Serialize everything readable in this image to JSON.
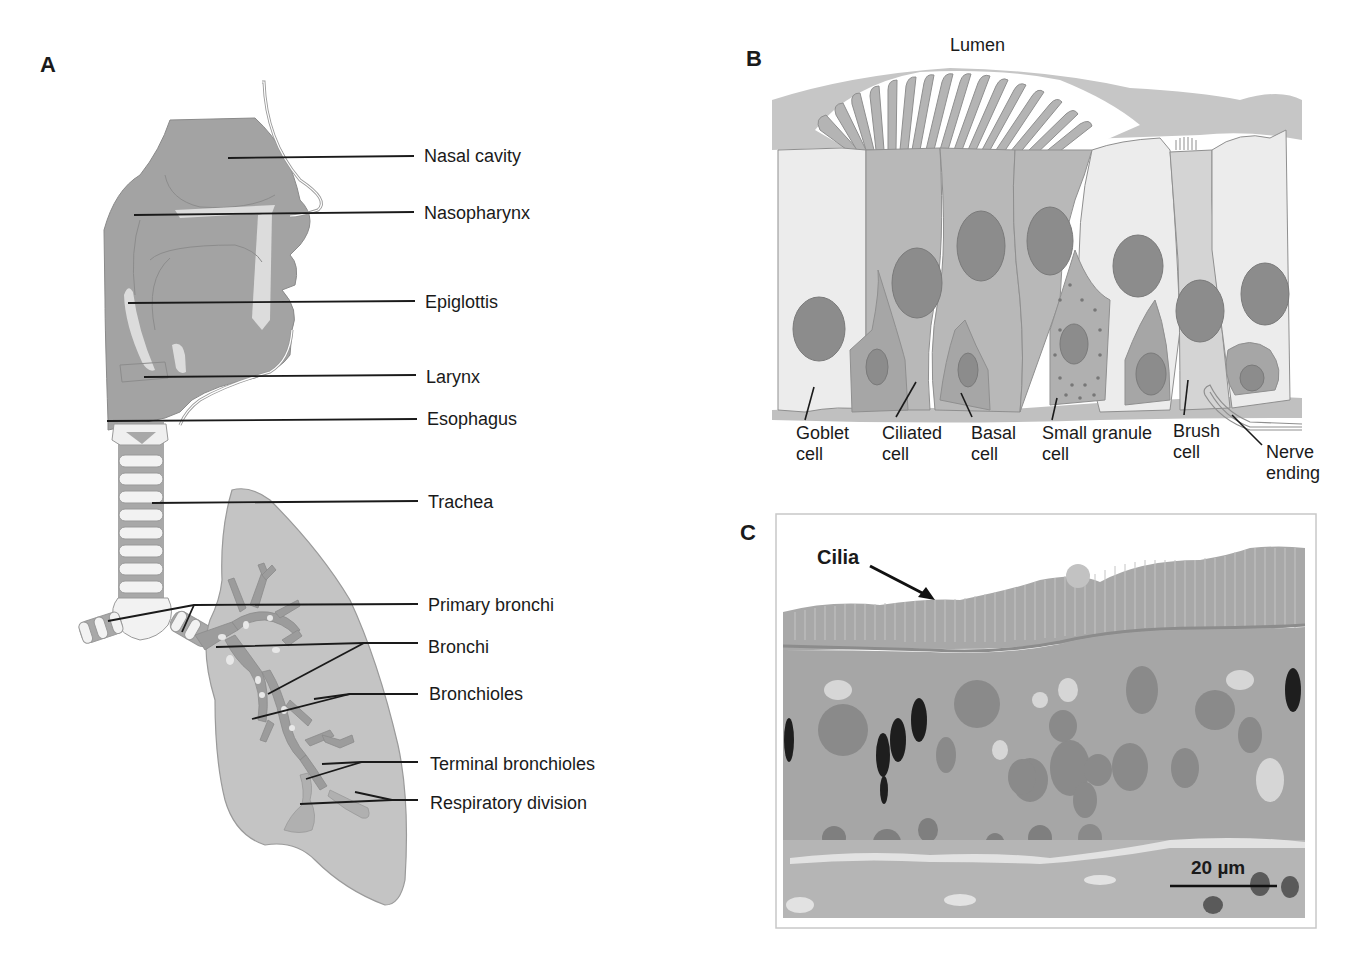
{
  "figure": {
    "panels": {
      "A": {
        "letter": "A",
        "title": "Respiratory tract anatomy",
        "labels": [
          {
            "id": "nasal-cavity",
            "text": "Nasal cavity"
          },
          {
            "id": "nasopharynx",
            "text": "Nasopharynx"
          },
          {
            "id": "epiglottis",
            "text": "Epiglottis"
          },
          {
            "id": "larynx",
            "text": "Larynx"
          },
          {
            "id": "esophagus",
            "text": "Esophagus"
          },
          {
            "id": "trachea",
            "text": "Trachea"
          },
          {
            "id": "primary-bronchi",
            "text": "Primary bronchi"
          },
          {
            "id": "bronchi",
            "text": "Bronchi"
          },
          {
            "id": "bronchioles",
            "text": "Bronchioles"
          },
          {
            "id": "terminal-bronchioles",
            "text": "Terminal bronchioles"
          },
          {
            "id": "respiratory-division",
            "text": "Respiratory division"
          }
        ]
      },
      "B": {
        "letter": "B",
        "top_labels": {
          "lumen": "Lumen",
          "mucus": "Mucus"
        },
        "cells": [
          {
            "id": "goblet",
            "text": "Goblet\ncell"
          },
          {
            "id": "ciliated",
            "text": "Ciliated\ncell"
          },
          {
            "id": "basal",
            "text": "Basal\ncell"
          },
          {
            "id": "small-granule",
            "text": "Small granule\ncell"
          },
          {
            "id": "brush",
            "text": "Brush\ncell"
          },
          {
            "id": "nerve",
            "text": "Nerve\nending"
          }
        ]
      },
      "C": {
        "letter": "C",
        "annotation": "Cilia",
        "scale_bar": "20 µm"
      }
    },
    "colors": {
      "tissue_dark": "#9a9a9a",
      "tissue_mid": "#b4b4b4",
      "tissue_light": "#d0d0d0",
      "cell_light": "#ebebeb",
      "nucleus": "#8a8a8a",
      "leader_line": "#1a1a1a"
    }
  }
}
